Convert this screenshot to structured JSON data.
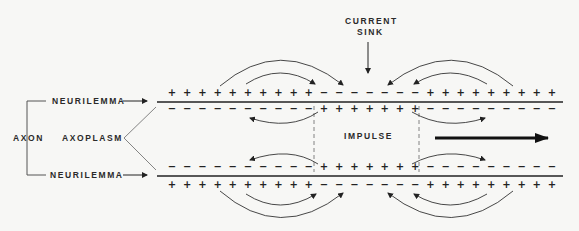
{
  "diagram": {
    "labels": {
      "current_sink_line1": "CURRENT",
      "current_sink_line2": "SINK",
      "neurilemma_top": "NEURILEMMA",
      "neurilemma_bottom": "NEURILEMMA",
      "axon": "AXON",
      "axoplasm": "AXOPLASM",
      "impulse": "IMPULSE"
    },
    "charges": {
      "top_outer": [
        "+",
        "+",
        "+",
        "+",
        "+",
        "+",
        "+",
        "+",
        "+",
        "+",
        "−",
        "−",
        "−",
        "−",
        "−",
        "−",
        "−",
        "+",
        "+",
        "+",
        "+",
        "+",
        "+",
        "+",
        "+",
        "+"
      ],
      "top_inner": [
        "−",
        "−",
        "−",
        "−",
        "−",
        "−",
        "−",
        "−",
        "−",
        "−",
        "+",
        "+",
        "+",
        "+",
        "+",
        "+",
        "+",
        "−",
        "−",
        "−",
        "−",
        "−",
        "−",
        "−",
        "−",
        "−"
      ],
      "bottom_inner": [
        "−",
        "−",
        "−",
        "−",
        "−",
        "−",
        "−",
        "−",
        "−",
        "−",
        "+",
        "+",
        "+",
        "+",
        "+",
        "+",
        "+",
        "−",
        "−",
        "−",
        "−",
        "−",
        "−",
        "−",
        "−",
        "−"
      ],
      "bottom_outer": [
        "+",
        "+",
        "+",
        "+",
        "+",
        "+",
        "+",
        "+",
        "+",
        "+",
        "−",
        "−",
        "−",
        "−",
        "−",
        "−",
        "−",
        "+",
        "+",
        "+",
        "+",
        "+",
        "+",
        "+",
        "+",
        "+"
      ]
    },
    "impulse_direction": "right",
    "colors": {
      "ink": "#222222",
      "background": "#f7f7f5"
    }
  }
}
